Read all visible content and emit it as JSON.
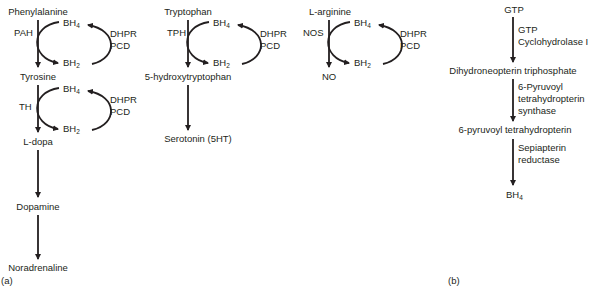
{
  "panel_a": {
    "label": "(a)",
    "phe": {
      "substrate": "Phenylalanine",
      "enzyme1": "PAH",
      "product1": "Tyrosine",
      "enzyme2": "TH",
      "product2": "L-dopa",
      "product3": "Dopamine",
      "product4": "Noradrenaline"
    },
    "trp": {
      "substrate": "Tryptophan",
      "enzyme": "TPH",
      "product1": "5-hydroxytryptophan",
      "product2": "Serotonin (5HT)"
    },
    "arg": {
      "substrate": "L-arginine",
      "enzyme": "NOS",
      "product": "NO"
    },
    "cofactor": {
      "bh4": "BH",
      "bh4_sub": "4",
      "bh2": "BH",
      "bh2_sub": "2",
      "recycle1": "DHPR",
      "recycle2": "PCD"
    }
  },
  "panel_b": {
    "label": "(b)",
    "steps": [
      "GTP",
      "Dihydroneopterin triphosphate",
      "6-pyruvoyl tetrahydropterin",
      "BH"
    ],
    "final_sub": "4",
    "enzymes": [
      [
        "GTP",
        "Cyclohydrolase I"
      ],
      [
        "6-Pyruvoyl",
        "tetrahydropterin",
        "synthase"
      ],
      [
        "Sepiapterin",
        "reductase"
      ]
    ]
  }
}
